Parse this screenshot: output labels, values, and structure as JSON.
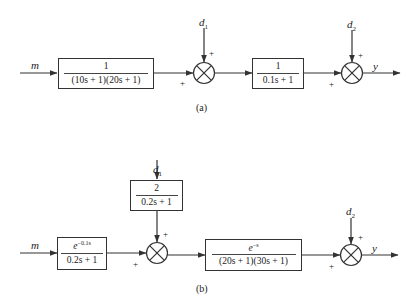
{
  "diagram_a": {
    "caption": "(a)",
    "input_label": "m",
    "output_label": "y",
    "blocks": [
      {
        "id": "G1",
        "numerator": "1",
        "denominator": "(10s + 1)(20s + 1)"
      },
      {
        "id": "G2",
        "numerator": "1",
        "denominator": "0.1s + 1"
      }
    ],
    "summing_junctions": [
      {
        "id": "S1",
        "disturbance": "d",
        "disturbance_sub": "1",
        "sign_top": "+",
        "sign_left": "+"
      },
      {
        "id": "S2",
        "disturbance": "d",
        "disturbance_sub": "2",
        "sign_top": "+",
        "sign_left": "+"
      }
    ]
  },
  "diagram_b": {
    "caption": "(b)",
    "input_label": "m",
    "output_label": "y",
    "blocks": [
      {
        "id": "Gp1",
        "numerator_base": "e",
        "numerator_exp": "−0.1s",
        "denominator": "0.2s + 1"
      },
      {
        "id": "Gd1",
        "numerator": "2",
        "denominator": "0.2s + 1"
      },
      {
        "id": "Gp2",
        "numerator_base": "e",
        "numerator_exp": "−s",
        "denominator": "(20s + 1)(30s + 1)"
      }
    ],
    "summing_junctions": [
      {
        "id": "S1",
        "disturbance": "d",
        "disturbance_sub": "1",
        "sign_top": "+",
        "sign_left": "+"
      },
      {
        "id": "S2",
        "disturbance": "d",
        "disturbance_sub": "2",
        "sign_top": "+",
        "sign_left": "+"
      }
    ]
  }
}
